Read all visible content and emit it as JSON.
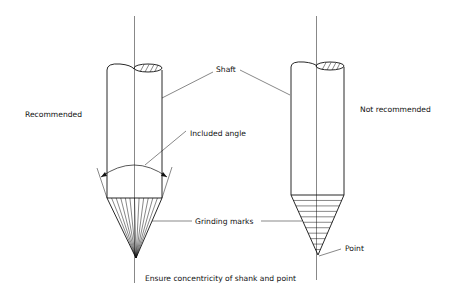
{
  "labels": {
    "recommended": "Recommended",
    "not_recommended": "Not recommended",
    "shaft": "Shaft",
    "included_angle": "Included angle",
    "grinding_marks": "Grinding marks",
    "point": "Point",
    "concentricity": "Ensure concentricity of shank and point"
  },
  "colors": {
    "line": "#111111",
    "background": "#ffffff"
  }
}
